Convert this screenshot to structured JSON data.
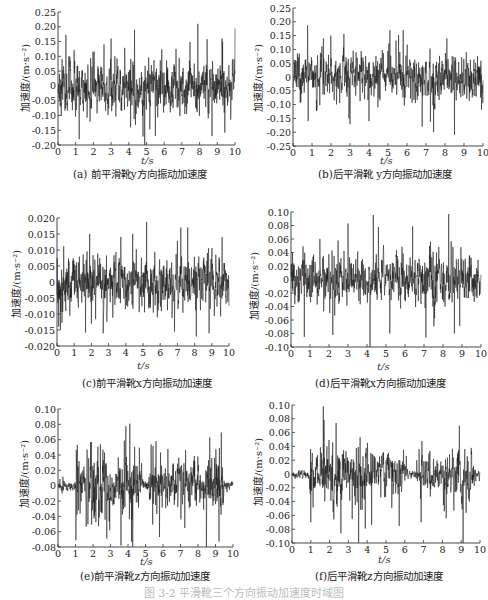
{
  "figure_caption": "图 3-2  平滑靴三个方向振动加速度时域图",
  "chart_data": [
    {
      "id": "a",
      "type": "line",
      "title": "(a) 前平滑靴y方向振动加速度",
      "xlabel": "t/s",
      "ylabel": "加速度/(m·s⁻²)",
      "xlim": [
        0,
        10
      ],
      "ylim": [
        -0.2,
        0.25
      ],
      "xticks": [
        "0",
        "1",
        "2",
        "3",
        "4",
        "5",
        "6",
        "7",
        "8",
        "9",
        "10"
      ],
      "yticks": [
        "0.25",
        "0.20",
        "0.15",
        "0.10",
        "0.05",
        "0",
        "-0.05",
        "-0.10",
        "-0.15",
        "-0.20"
      ],
      "ytick_values": [
        0.25,
        0.2,
        0.15,
        0.1,
        0.05,
        0,
        -0.05,
        -0.1,
        -0.15,
        -0.2
      ],
      "grid": false,
      "amplitude": 0.06,
      "peaks": [
        [
          1.2,
          -0.18
        ],
        [
          2.6,
          0.14
        ],
        [
          3.0,
          0.16
        ],
        [
          4.9,
          0.21
        ],
        [
          4.9,
          -0.2
        ],
        [
          5.5,
          -0.17
        ],
        [
          7.9,
          0.21
        ],
        [
          8.7,
          -0.17
        ],
        [
          9.3,
          0.15
        ],
        [
          4.1,
          -0.14
        ]
      ],
      "envelope": "stationary",
      "seed": 11
    },
    {
      "id": "b",
      "type": "line",
      "title": "(b)后平滑靴 y方向振动加速度",
      "xlabel": "t/s",
      "ylabel": "加速度/(m·s⁻²)",
      "xlim": [
        0,
        10
      ],
      "ylim": [
        -0.25,
        0.25
      ],
      "xticks": [
        "0",
        "1",
        "2",
        "3",
        "4",
        "5",
        "6",
        "7",
        "8",
        "9",
        "10"
      ],
      "yticks": [
        "0.25",
        "0.20",
        "0.15",
        "0.10",
        "0.05",
        "0",
        "-0.05",
        "-0.10",
        "-0.15",
        "-0.20",
        "-0.25"
      ],
      "ytick_values": [
        0.25,
        0.2,
        0.15,
        0.1,
        0.05,
        0,
        -0.05,
        -0.1,
        -0.15,
        -0.2,
        -0.25
      ],
      "grid": false,
      "amplitude": 0.055,
      "peaks": [
        [
          0.8,
          -0.16
        ],
        [
          4.0,
          0.22
        ],
        [
          4.0,
          -0.16
        ],
        [
          5.1,
          0.17
        ],
        [
          5.8,
          0.17
        ],
        [
          6.8,
          -0.18
        ],
        [
          7.4,
          -0.2
        ],
        [
          8.5,
          -0.21
        ],
        [
          1.6,
          0.14
        ],
        [
          8.1,
          0.14
        ]
      ],
      "envelope": "stationary",
      "seed": 23
    },
    {
      "id": "c",
      "type": "line",
      "title": "(c)前平滑靴x方向振动加速度",
      "xlabel": "t/s",
      "ylabel": "加速度/(m·s⁻²)",
      "xlim": [
        0,
        10
      ],
      "ylim": [
        -0.02,
        0.02
      ],
      "xticks": [
        "0",
        "1",
        "2",
        "3",
        "4",
        "5",
        "6",
        "7",
        "8",
        "9",
        "10"
      ],
      "yticks": [
        "0.020",
        "0.015",
        "0.010",
        "0.005",
        "0",
        "-0.005",
        "-0.010",
        "-0.015",
        "-0.020"
      ],
      "ytick_values": [
        0.02,
        0.015,
        0.01,
        0.005,
        0,
        -0.005,
        -0.01,
        -0.015,
        -0.02
      ],
      "grid": false,
      "amplitude": 0.0055,
      "peaks": [
        [
          0.1,
          -0.014
        ],
        [
          0.2,
          -0.015
        ],
        [
          1.9,
          0.015
        ],
        [
          2.0,
          -0.013
        ],
        [
          4.4,
          0.015
        ],
        [
          7.2,
          0.017
        ],
        [
          7.6,
          0.017
        ],
        [
          8.1,
          -0.017
        ],
        [
          9.6,
          0.014
        ]
      ],
      "envelope": "stationary",
      "seed": 37
    },
    {
      "id": "d",
      "type": "line",
      "title": "(d)后平滑靴x方向振动加速度",
      "xlabel": "t/s",
      "ylabel": "加速度/(m·s⁻²)",
      "xlim": [
        0,
        10
      ],
      "ylim": [
        -0.1,
        0.1
      ],
      "xticks": [
        "0",
        "1",
        "2",
        "3",
        "4",
        "5",
        "6",
        "7",
        "8",
        "9",
        "10"
      ],
      "yticks": [
        "0.10",
        "0.08",
        "0.06",
        "0.04",
        "0.02",
        "0",
        "-0.02",
        "-0.04",
        "-0.06",
        "-0.08",
        "-0.10"
      ],
      "ytick_values": [
        0.1,
        0.08,
        0.06,
        0.04,
        0.02,
        0,
        -0.02,
        -0.04,
        -0.06,
        -0.08,
        -0.1
      ],
      "grid": false,
      "amplitude": 0.025,
      "peaks": [
        [
          0.7,
          -0.085
        ],
        [
          2.2,
          -0.082
        ],
        [
          3.0,
          0.083
        ],
        [
          4.6,
          0.078
        ],
        [
          5.2,
          -0.08
        ],
        [
          7.1,
          -0.086
        ],
        [
          8.3,
          0.097
        ],
        [
          8.6,
          -0.08
        ],
        [
          6.4,
          0.079
        ]
      ],
      "envelope": "stationary",
      "seed": 53
    },
    {
      "id": "e",
      "type": "line",
      "title": "(e)前平滑靴z方向振动加速度",
      "xlabel": "t/s",
      "ylabel": "加速度/(m·s⁻²)",
      "xlim": [
        0,
        10
      ],
      "ylim": [
        -0.08,
        0.1
      ],
      "xticks": [
        "0",
        "1",
        "2",
        "3",
        "4",
        "5",
        "6",
        "7",
        "8",
        "9",
        "10"
      ],
      "yticks": [
        "0.10",
        "0.08",
        "0.06",
        "0.04",
        "0.02",
        "0",
        "-0.02",
        "-0.04",
        "-0.06",
        "-0.08"
      ],
      "ytick_values": [
        0.1,
        0.08,
        0.06,
        0.04,
        0.02,
        0,
        -0.02,
        -0.04,
        -0.06,
        -0.08
      ],
      "grid": false,
      "amplitude": 0.03,
      "peaks": [
        [
          1.1,
          0.053
        ],
        [
          1.9,
          0.057
        ],
        [
          3.6,
          -0.078
        ],
        [
          4.1,
          0.081
        ],
        [
          4.2,
          -0.073
        ],
        [
          5.6,
          0.058
        ],
        [
          5.8,
          -0.067
        ],
        [
          9.2,
          0.079
        ],
        [
          9.2,
          -0.073
        ]
      ],
      "envelope": "bursty",
      "quiet": [
        [
          0,
          1.0
        ],
        [
          4.8,
          5.2
        ],
        [
          9.5,
          10
        ]
      ],
      "seed": 71
    },
    {
      "id": "f",
      "type": "line",
      "title": "(f)后平滑靴z方向振动加速度",
      "xlabel": "t/s",
      "ylabel": "加速度/(m·s⁻²)",
      "xlim": [
        0,
        10
      ],
      "ylim": [
        -0.1,
        0.1
      ],
      "xticks": [
        "0",
        "1",
        "2",
        "3",
        "4",
        "5",
        "6",
        "7",
        "8",
        "9",
        "10"
      ],
      "yticks": [
        "0.10",
        "0.08",
        "0.06",
        "0.04",
        "0.02",
        "0",
        "-0.02",
        "-0.04",
        "-0.06",
        "-0.08",
        "-0.10"
      ],
      "ytick_values": [
        0.1,
        0.08,
        0.06,
        0.04,
        0.02,
        0,
        -0.02,
        -0.04,
        -0.06,
        -0.08,
        -0.1
      ],
      "grid": false,
      "amplitude": 0.03,
      "peaks": [
        [
          1.0,
          -0.07
        ],
        [
          1.7,
          0.078
        ],
        [
          3.2,
          -0.065
        ],
        [
          3.9,
          0.083
        ],
        [
          3.9,
          -0.079
        ],
        [
          5.7,
          -0.075
        ],
        [
          8.9,
          0.07
        ],
        [
          8.2,
          -0.064
        ]
      ],
      "envelope": "bursty",
      "quiet": [
        [
          0,
          0.9
        ],
        [
          6.1,
          6.6
        ],
        [
          9.7,
          10
        ]
      ],
      "seed": 89
    }
  ]
}
